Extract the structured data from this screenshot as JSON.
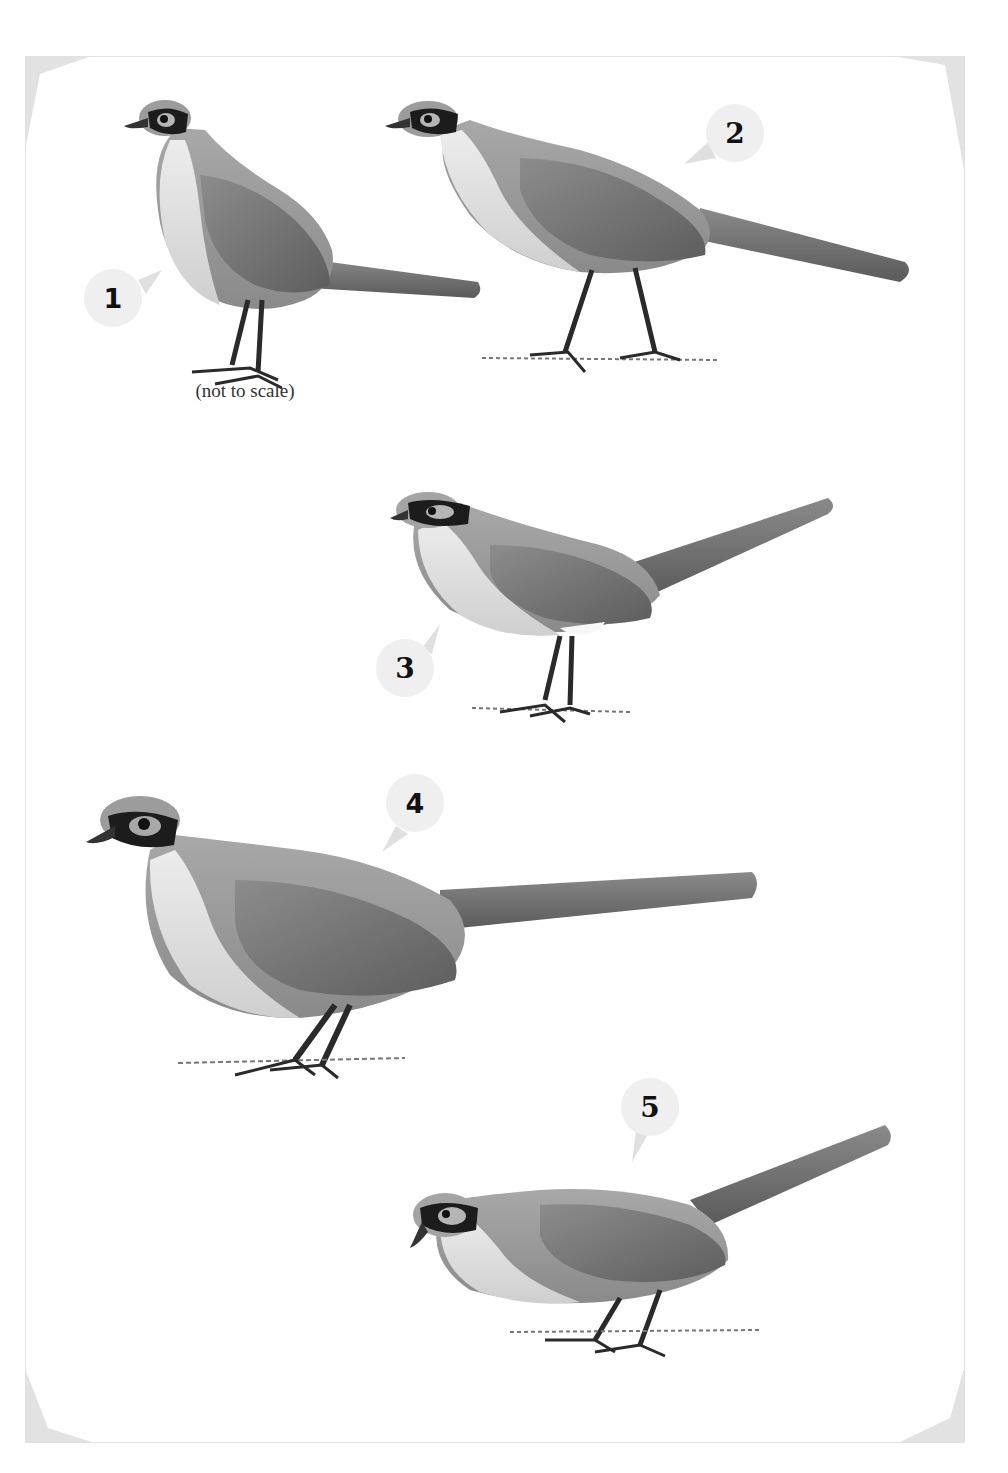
{
  "plate": {
    "caption": "(not to scale)",
    "colors": {
      "background": "#ffffff",
      "frame": "#e4e4e4",
      "corner_fill": "#e2e2e2",
      "badge_fill": "#efefef",
      "label_text": "#111111",
      "plumage_body": "#9a9a9a",
      "plumage_wing": "#7a7a7a",
      "plumage_underparts": "#e4e4e4",
      "mask": "#1c1c1c"
    },
    "labels": [
      {
        "number": "1"
      },
      {
        "number": "2"
      },
      {
        "number": "3"
      },
      {
        "number": "4"
      },
      {
        "number": "5"
      }
    ],
    "illustrations": [
      {
        "id": "1",
        "subject": "bird, standing upright, long tail, dark eye mask"
      },
      {
        "id": "2",
        "subject": "bird, walking, long tail, dark eye mask"
      },
      {
        "id": "3",
        "subject": "bird, standing, tail raised, dark eye mask"
      },
      {
        "id": "4",
        "subject": "bird, large, standing, long tail, dark eye mask"
      },
      {
        "id": "5",
        "subject": "bird, crouching, tail raised, dark eye mask"
      }
    ]
  }
}
